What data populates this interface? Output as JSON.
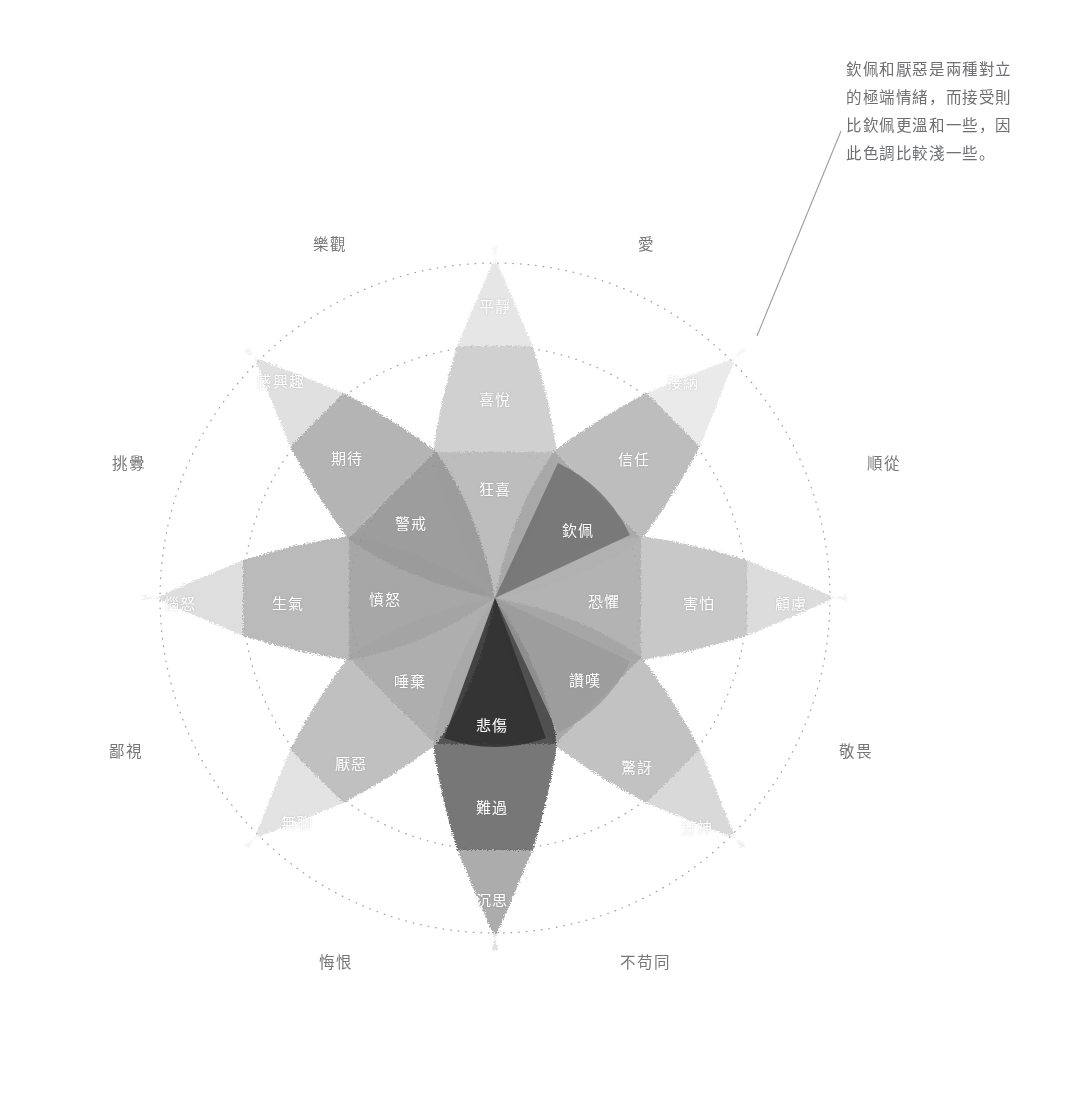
{
  "figure": {
    "kind": "emotion-wheel",
    "center": {
      "x": 495,
      "y": 598
    },
    "rings": [
      146,
      252,
      335
    ],
    "annotation": {
      "text": "欽佩和厭惡是兩種對立\n的極端情緒，而接受則\n比欽佩更溫和一些，因\n此色調比較淺一些。",
      "leader_from": {
        "x": 841,
        "y": 131
      },
      "leader_to": {
        "x": 757,
        "y": 336
      }
    }
  },
  "colors": {
    "background": "#ffffff",
    "ring_stroke": "#8c8e90",
    "annotation_text": "#6d6f72",
    "dyad_text": "#75777a",
    "petal_text": "#ffffff"
  },
  "dyads": [
    {
      "label": "樂觀",
      "x": 330,
      "y": 243
    },
    {
      "label": "愛",
      "x": 646,
      "y": 243
    },
    {
      "label": "順從",
      "x": 884,
      "y": 462
    },
    {
      "label": "敬畏",
      "x": 856,
      "y": 750
    },
    {
      "label": "不苟同",
      "x": 645,
      "y": 961
    },
    {
      "label": "悔恨",
      "x": 336,
      "y": 961
    },
    {
      "label": "鄙視",
      "x": 126,
      "y": 750
    },
    {
      "label": "挑釁",
      "x": 129,
      "y": 462
    }
  ],
  "petals": [
    {
      "name": "joy",
      "angle": -90,
      "levels": [
        {
          "label": "狂喜",
          "tone": "#b4b4b4",
          "r": 96
        },
        {
          "label": "喜悅",
          "tone": "#c6c6c6",
          "r": 200
        },
        {
          "label": "平靜",
          "tone": "#dcdcdc",
          "r": 296
        }
      ]
    },
    {
      "name": "trust",
      "angle": -45,
      "levels": [
        {
          "label": "信任",
          "tone": "#9d9d9d",
          "r": 96
        },
        {
          "label": "接納",
          "tone": "#b0b0b0",
          "r": 200
        },
        {
          "label": "",
          "tone": "#e2e2e2",
          "r": 296
        }
      ]
    },
    {
      "name": "fear",
      "angle": 0,
      "levels": [
        {
          "label": "恐懼",
          "tone": "#a8a8a8",
          "r": 96
        },
        {
          "label": "害怕",
          "tone": "#bcbcbc",
          "r": 200
        },
        {
          "label": "顧慮",
          "tone": "#cfcfcf",
          "r": 296
        }
      ]
    },
    {
      "name": "surprise",
      "angle": 45,
      "levels": [
        {
          "label": "讚嘆",
          "tone": "#9c9c9c",
          "r": 96
        },
        {
          "label": "驚訝",
          "tone": "#b6b6b6",
          "r": 200
        },
        {
          "label": "分神",
          "tone": "#cacaca",
          "r": 296
        }
      ]
    },
    {
      "name": "sadness",
      "angle": 90,
      "levels": [
        {
          "label": "悲傷",
          "tone": "#3b3b3b",
          "r": 96
        },
        {
          "label": "難過",
          "tone": "#5b5b5b",
          "r": 200
        },
        {
          "label": "沉思",
          "tone": "#8c8c8c",
          "r": 296
        }
      ]
    },
    {
      "name": "disgust",
      "angle": 135,
      "levels": [
        {
          "label": "厭惡",
          "tone": "#a2a2a2",
          "r": 96
        },
        {
          "label": "無聊",
          "tone": "#b4b4b4",
          "r": 200
        },
        {
          "label": "",
          "tone": "#d8d8d8",
          "r": 296
        }
      ]
    },
    {
      "name": "anger",
      "angle": 180,
      "levels": [
        {
          "label": "生氣",
          "tone": "#9a9a9a",
          "r": 96
        },
        {
          "label": "惱怒",
          "tone": "#ababab",
          "r": 200
        },
        {
          "label": "",
          "tone": "#d2d2d2",
          "r": 296
        }
      ]
    },
    {
      "name": "anticipation",
      "angle": -135,
      "levels": [
        {
          "label": "期待",
          "tone": "#8f8f8f",
          "r": 96
        },
        {
          "label": "感興趣",
          "tone": "#a5a5a5",
          "r": 200
        },
        {
          "label": "",
          "tone": "#d4d4d4",
          "r": 296
        }
      ]
    }
  ],
  "inner_wedges": [
    {
      "label": "狂喜",
      "x": 495,
      "y": 488,
      "tone": "#b9b9b9"
    },
    {
      "label": "欽佩",
      "x": 578,
      "y": 529,
      "tone": "#6f6f6f"
    },
    {
      "label": "恐懼",
      "x": 604,
      "y": 598,
      "tone": "#ababab"
    },
    {
      "label": "讚嘆",
      "x": 585,
      "y": 679,
      "tone": "#9c9c9c"
    },
    {
      "label": "悲傷",
      "x": 495,
      "y": 724,
      "tone": "#2f2f2f"
    },
    {
      "label": "唾棄",
      "x": 410,
      "y": 680,
      "tone": "#9e9e9e"
    },
    {
      "label": "憤怒",
      "x": 385,
      "y": 598,
      "tone": "#8b8b8b"
    },
    {
      "label": "警戒",
      "x": 411,
      "y": 522,
      "tone": "#9b9b9b"
    }
  ],
  "petal_label_positions": [
    {
      "label": "平靜",
      "x": 495,
      "y": 305
    },
    {
      "label": "喜悅",
      "x": 495,
      "y": 398
    },
    {
      "label": "狂喜",
      "x": 495,
      "y": 488
    },
    {
      "label": "接納",
      "x": 683,
      "y": 381
    },
    {
      "label": "信任",
      "x": 634,
      "y": 458
    },
    {
      "label": "欽佩",
      "x": 578,
      "y": 529
    },
    {
      "label": "顧慮",
      "x": 791,
      "y": 602
    },
    {
      "label": "害怕",
      "x": 699,
      "y": 602
    },
    {
      "label": "恐懼",
      "x": 604,
      "y": 600
    },
    {
      "label": "分神",
      "x": 697,
      "y": 826
    },
    {
      "label": "驚訝",
      "x": 637,
      "y": 766
    },
    {
      "label": "讚嘆",
      "x": 585,
      "y": 679
    },
    {
      "label": "沉思",
      "x": 492,
      "y": 899
    },
    {
      "label": "難過",
      "x": 492,
      "y": 806
    },
    {
      "label": "悲傷",
      "x": 492,
      "y": 724
    },
    {
      "label": "無聊",
      "x": 297,
      "y": 821
    },
    {
      "label": "厭惡",
      "x": 351,
      "y": 762
    },
    {
      "label": "唾棄",
      "x": 410,
      "y": 680
    },
    {
      "label": "惱怒",
      "x": 180,
      "y": 602
    },
    {
      "label": "生氣",
      "x": 288,
      "y": 602
    },
    {
      "label": "憤怒",
      "x": 385,
      "y": 598
    },
    {
      "label": "感興趣",
      "x": 281,
      "y": 380
    },
    {
      "label": "期待",
      "x": 347,
      "y": 457
    },
    {
      "label": "警戒",
      "x": 411,
      "y": 522
    }
  ]
}
